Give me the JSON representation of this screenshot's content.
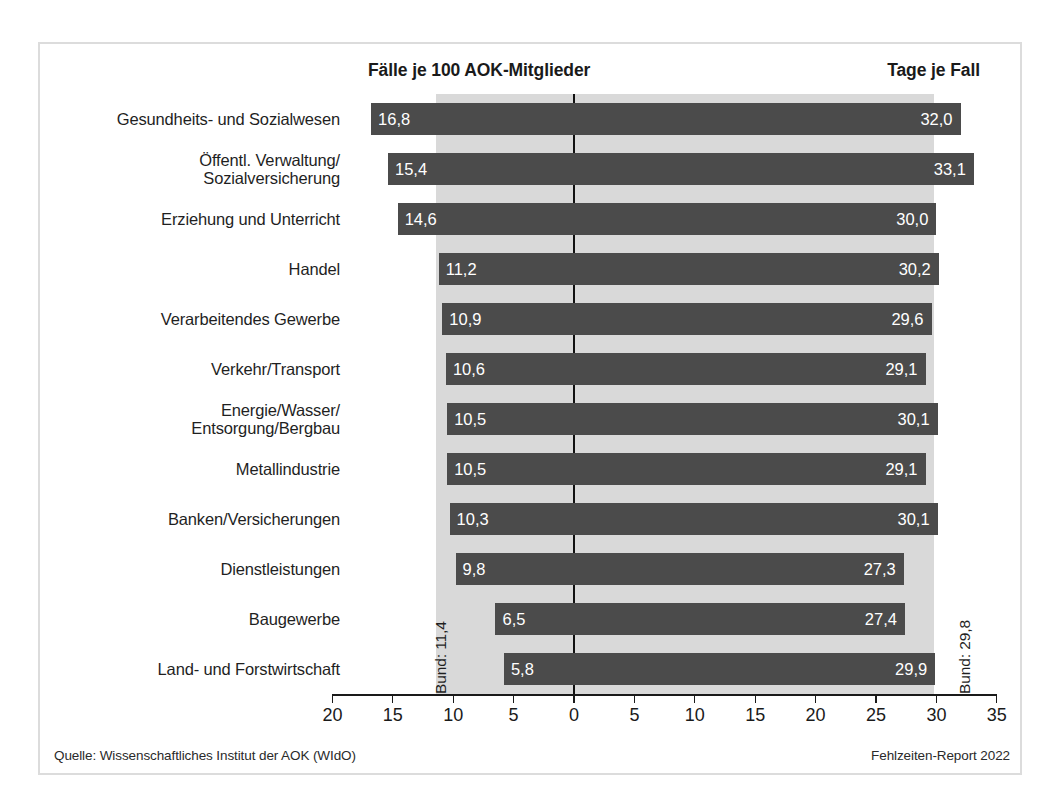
{
  "header": {
    "left_title": "Fälle je 100 AOK-Mitglieder",
    "right_title": "Tage je Fall"
  },
  "annotations": {
    "bund_left": "Bund: 11,4",
    "bund_right": "Bund: 29,8"
  },
  "footer": {
    "source": "Quelle: Wissenschaftliches Institut der AOK (WIdO)",
    "report": "Fehlzeiten-Report 2022"
  },
  "colors": {
    "bar": "#4b4b4b",
    "band": "#d9d9d9",
    "frame": "#dcdcdc",
    "axis": "#1a1a1a",
    "value_text": "#ffffff"
  },
  "chart_data": {
    "type": "bar",
    "title": "",
    "orientation": "horizontal-diverging",
    "grid": false,
    "legend": null,
    "categories": [
      "Gesundheits- und Sozialwesen",
      "Öffentl. Verwaltung/\nSozialversicherung",
      "Erziehung und Unterricht",
      "Handel",
      "Verarbeitendes Gewerbe",
      "Verkehr/Transport",
      "Energie/Wasser/\nEntsorgung/Bergbau",
      "Metallindustrie",
      "Banken/Versicherungen",
      "Dienstleistungen",
      "Baugewerbe",
      "Land- und Forstwirtschaft"
    ],
    "series": [
      {
        "name": "Fälle je 100 AOK-Mitglieder",
        "side": "left",
        "values": [
          16.8,
          15.4,
          14.6,
          11.2,
          10.9,
          10.6,
          10.5,
          10.5,
          10.3,
          9.8,
          6.5,
          5.8
        ],
        "labels": [
          "16,8",
          "15,4",
          "14,6",
          "11,2",
          "10,9",
          "10,6",
          "10,5",
          "10,5",
          "10,3",
          "9,8",
          "6,5",
          "5,8"
        ],
        "reference_line": 11.4,
        "reference_label": "Bund: 11,4"
      },
      {
        "name": "Tage je Fall",
        "side": "right",
        "values": [
          32.0,
          33.1,
          30.0,
          30.2,
          29.6,
          29.1,
          30.1,
          29.1,
          30.1,
          27.3,
          27.4,
          29.9
        ],
        "labels": [
          "32,0",
          "33,1",
          "30,0",
          "30,2",
          "29,6",
          "29,1",
          "30,1",
          "29,1",
          "30,1",
          "27,3",
          "27,4",
          "29,9"
        ],
        "reference_line": 29.8,
        "reference_label": "Bund: 29,8"
      }
    ],
    "axis": {
      "left_max": 20,
      "right_max": 35,
      "tick_labels": [
        "20",
        "15",
        "10",
        "5",
        "0",
        "5",
        "10",
        "15",
        "20",
        "25",
        "30",
        "35"
      ],
      "tick_values": [
        -20,
        -15,
        -10,
        -5,
        0,
        5,
        10,
        15,
        20,
        25,
        30,
        35
      ]
    },
    "xlabel": "",
    "ylabel": ""
  }
}
